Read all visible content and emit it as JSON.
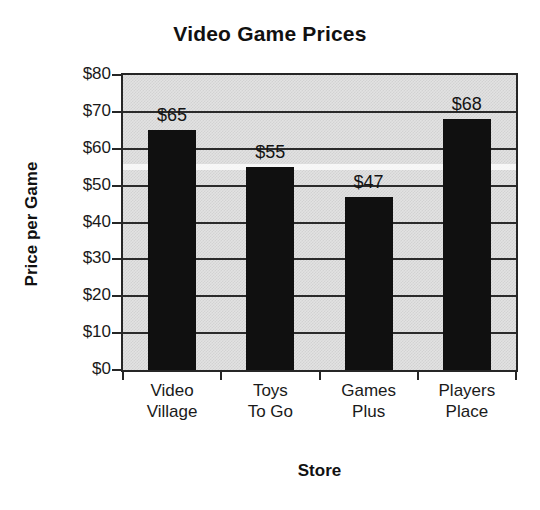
{
  "chart_data": {
    "type": "bar",
    "title": "Video Game Prices",
    "xlabel": "Store",
    "ylabel": "Price per Game",
    "categories": [
      "Video Village",
      "Toys To Go",
      "Games Plus",
      "Players Place"
    ],
    "category_lines": [
      [
        "Video",
        "Village"
      ],
      [
        "Toys",
        "To Go"
      ],
      [
        "Games",
        "Plus"
      ],
      [
        "Players",
        "Place"
      ]
    ],
    "values": [
      65,
      55,
      47,
      68
    ],
    "value_labels": [
      "$65",
      "$55",
      "$47",
      "$68"
    ],
    "ylim": [
      0,
      80
    ],
    "ytick_values": [
      0,
      10,
      20,
      30,
      40,
      50,
      60,
      70,
      80
    ],
    "ytick_labels": [
      "$0",
      "$10",
      "$20",
      "$30",
      "$40",
      "$50",
      "$60",
      "$70",
      "$80"
    ],
    "grid": true,
    "grid_axis": "y",
    "legend": false,
    "bar_color": "#101010",
    "plot_background": "#e2e2e2",
    "axis_color": "#262626",
    "text_color": "#1a1a1a"
  }
}
